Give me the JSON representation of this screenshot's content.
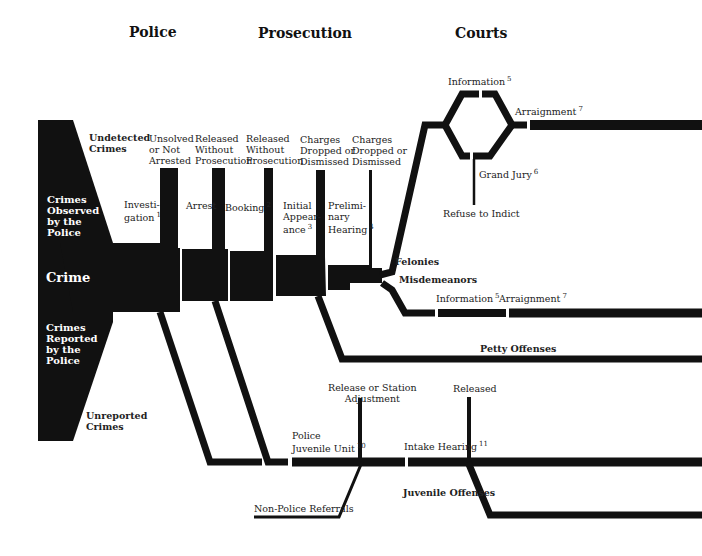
{
  "headers": {
    "police": "Police",
    "prosecution": "Prosecution",
    "courts": "Courts"
  },
  "crime_block": {
    "undetected": "Undetected\nCrimes",
    "observed": "Crimes\nObserved\nby the\nPolice",
    "crime": "Crime",
    "reported": "Crimes\nReported\nby the\nPolice",
    "unreported": "Unreported\nCrimes"
  },
  "exits": {
    "unsolved": "Unsolved\nor Not\nArrested",
    "released1": "Released\nWithout\nProsecution",
    "released2": "Released\nWithout\nProsecution",
    "dropped1": "Charges\nDropped or\nDismissed",
    "dropped2": "Charges\nDropped or\nDismissed"
  },
  "stages": {
    "investigation": {
      "label": "Investi-\ngation",
      "note": "1"
    },
    "arrest": {
      "label": "Arrest"
    },
    "booking": {
      "label": "Booking",
      "note": "2"
    },
    "initial_appearance": {
      "label": "Initial\nAppear-\nance",
      "note": "3"
    },
    "preliminary_hearing": {
      "label": "Prelimi-\nnary\nHearing",
      "note": "4"
    }
  },
  "felony_path": {
    "felonies": "Felonies",
    "information": {
      "label": "Information",
      "note": "5"
    },
    "grand_jury": {
      "label": "Grand Jury",
      "note": "6"
    },
    "refuse": "Refuse to Indict",
    "arraignment": {
      "label": "Arraignment",
      "note": "7"
    }
  },
  "misdemeanor_path": {
    "misdemeanors": "Misdemeanors",
    "information": {
      "label": "Information",
      "note": "5"
    },
    "arraignment": {
      "label": "Arraignment",
      "note": "7"
    }
  },
  "petty": {
    "label": "Petty Offenses"
  },
  "juvenile": {
    "unit": {
      "label": "Police\nJuvenile Unit",
      "note": "10"
    },
    "release_station": "Release or Station\nAdjustment",
    "intake": {
      "label": "Intake Hearing",
      "note": "11"
    },
    "released": "Released",
    "offenses": "Juvenile Offenses",
    "non_police": "Non-Police Referrals"
  },
  "colors": {
    "ink": "#111111",
    "background": "#ffffff"
  }
}
